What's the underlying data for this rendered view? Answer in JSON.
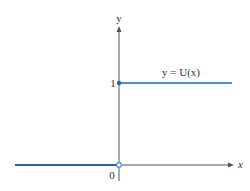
{
  "figure": {
    "y_axis_label": "y",
    "x_axis_label": "x",
    "origin_label": "0",
    "tick_one_label": "1",
    "function_label": "y = U(x)",
    "line_color": "#4a90d9",
    "axis_color": "#555555"
  }
}
